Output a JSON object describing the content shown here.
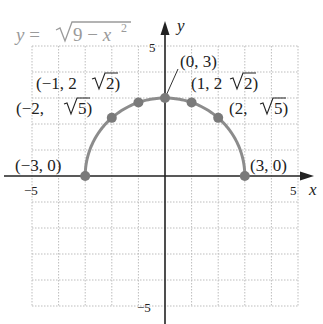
{
  "chart_data": {
    "type": "line",
    "title": "",
    "equation_label": "y = √(9 − x²)",
    "equation_parts": {
      "lhs": "y",
      "eq": " = ",
      "radicand_a": "9 − ",
      "radicand_var": "x",
      "exp": "2"
    },
    "xlabel": "x",
    "ylabel": "y",
    "xlim": [
      -5,
      5
    ],
    "ylim": [
      -5,
      5
    ],
    "grid": true,
    "grid_style": "dotted",
    "x_ticks_labeled": [
      -5,
      5
    ],
    "y_ticks_labeled": [
      5,
      -5
    ],
    "tick_labels": {
      "x_neg": "−5",
      "x_pos": "5",
      "y_pos": "5",
      "y_neg": "−5"
    },
    "curve": {
      "name": "y = sqrt(9 - x^2)",
      "domain": [
        -3,
        3
      ],
      "color": "#8c8c8c"
    },
    "points": [
      {
        "x": -3,
        "y": 0,
        "label": "(−3, 0)"
      },
      {
        "x": -2,
        "y": 2.236,
        "label": "(−2, √5)"
      },
      {
        "x": -1,
        "y": 2.828,
        "label": "(−1, 2√2)"
      },
      {
        "x": 0,
        "y": 3,
        "label": "(0, 3)"
      },
      {
        "x": 1,
        "y": 2.828,
        "label": "(1, 2√2)"
      },
      {
        "x": 2,
        "y": 2.236,
        "label": "(2, √5)"
      },
      {
        "x": 3,
        "y": 0,
        "label": "(3, 0)"
      }
    ],
    "point_color": "#7a7a7a",
    "axis_color": "#222222",
    "grid_color": "#bdbdbd"
  },
  "labels": {
    "p_m3": "(−3, 0)",
    "p_m2_a": "(−2, ",
    "p_m2_b": "5)",
    "p_m1_a": "(−1, 2",
    "p_m1_b": "2)",
    "p_0": "(0, 3)",
    "p_1_a": "(1, 2",
    "p_1_b": "2)",
    "p_2_a": "(2, ",
    "p_2_b": "5)",
    "p_3": "(3, 0)"
  }
}
